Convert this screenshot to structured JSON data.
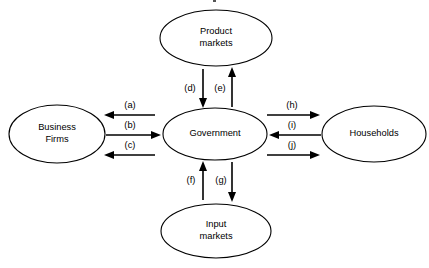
{
  "diagram": {
    "type": "flow-diagram",
    "background_color": "#ffffff",
    "line_color": "#000000",
    "nodes": [
      {
        "id": "product-markets",
        "label_line1": "Product",
        "label_line2": "markets",
        "position": "top",
        "cx": 216,
        "cy": 38,
        "rx": 56,
        "ry": 28
      },
      {
        "id": "business-firms",
        "label_line1": "Business",
        "label_line2": "Firms",
        "position": "left",
        "cx": 57,
        "cy": 134,
        "rx": 48,
        "ry": 29
      },
      {
        "id": "government",
        "label_line1": "Government",
        "label_line2": "",
        "position": "center",
        "cx": 215,
        "cy": 134,
        "rx": 52,
        "ry": 26
      },
      {
        "id": "households",
        "label_line1": "Households",
        "label_line2": "",
        "position": "right",
        "cx": 374,
        "cy": 134,
        "rx": 52,
        "ry": 28
      },
      {
        "id": "input-markets",
        "label_line1": "Input",
        "label_line2": "markets",
        "position": "bottom",
        "cx": 216,
        "cy": 231,
        "rx": 55,
        "ry": 27
      }
    ],
    "edges": [
      {
        "id": "edge-a",
        "label": "(a)",
        "from": "government",
        "to": "business-firms",
        "direction": "left",
        "label_x": 130,
        "label_y": 107,
        "x1": 155,
        "x2": 106,
        "y": 115
      },
      {
        "id": "edge-b",
        "label": "(b)",
        "from": "business-firms",
        "to": "government",
        "direction": "right",
        "label_x": 130,
        "label_y": 127,
        "x1": 106,
        "x2": 160,
        "y": 135
      },
      {
        "id": "edge-c",
        "label": "(c)",
        "from": "government",
        "to": "business-firms",
        "direction": "left",
        "label_x": 130,
        "label_y": 147,
        "x1": 155,
        "x2": 106,
        "y": 155
      },
      {
        "id": "edge-d",
        "label": "(d)",
        "from": "product-markets",
        "to": "government",
        "direction": "down",
        "label_x": 190,
        "label_y": 89,
        "y1": 70,
        "y2": 105,
        "x": 203
      },
      {
        "id": "edge-e",
        "label": "(e)",
        "from": "government",
        "to": "product-markets",
        "direction": "up",
        "label_x": 220,
        "label_y": 89,
        "y1": 105,
        "y2": 70,
        "x": 232
      },
      {
        "id": "edge-f",
        "label": "(f)",
        "from": "input-markets",
        "to": "government",
        "direction": "up",
        "label_x": 191,
        "label_y": 181,
        "y1": 199,
        "y2": 164,
        "x": 203
      },
      {
        "id": "edge-g",
        "label": "(g)",
        "from": "government",
        "to": "input-markets",
        "direction": "down",
        "label_x": 221,
        "label_y": 181,
        "y1": 164,
        "y2": 199,
        "x": 232
      },
      {
        "id": "edge-h",
        "label": "(h)",
        "from": "government",
        "to": "households",
        "direction": "right",
        "label_x": 292,
        "label_y": 107,
        "x1": 267,
        "x2": 318,
        "y": 115
      },
      {
        "id": "edge-i",
        "label": "(i)",
        "from": "households",
        "to": "government",
        "direction": "left",
        "label_x": 292,
        "label_y": 127,
        "x1": 320,
        "x2": 270,
        "y": 135
      },
      {
        "id": "edge-j",
        "label": "(j)",
        "from": "government",
        "to": "households",
        "direction": "right",
        "label_x": 292,
        "label_y": 147,
        "x1": 267,
        "x2": 318,
        "y": 155
      }
    ]
  }
}
